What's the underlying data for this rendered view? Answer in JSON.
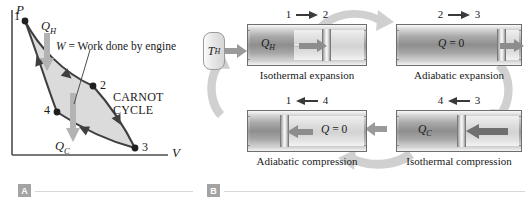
{
  "panel_a": {
    "tag": "A",
    "axes": {
      "y_label": "P",
      "x_label": "V"
    },
    "state_points": [
      {
        "id": "1",
        "label": "1"
      },
      {
        "id": "2",
        "label": "2"
      },
      {
        "id": "3",
        "label": "3"
      },
      {
        "id": "4",
        "label": "4"
      }
    ],
    "heat_in": {
      "symbol": "Q",
      "sub": "H"
    },
    "heat_out": {
      "symbol": "Q",
      "sub": "C"
    },
    "work_label": {
      "lhs": "W",
      "rest": " = Work done by engine"
    },
    "cycle_label_line1": "CARNOT",
    "cycle_label_line2": "CYCLE",
    "colors": {
      "curve": "#3f3f3f",
      "fill": "#d8d8d8",
      "heat_arrow": "#b0b0b0",
      "axis": "#4a4a4a"
    }
  },
  "panel_b": {
    "tag": "B",
    "reservoirs": [
      {
        "name": "hot",
        "symbol": "T",
        "sub": "H"
      },
      {
        "name": "cold",
        "symbol": "T",
        "sub": "C"
      }
    ],
    "stages": [
      {
        "id": "isothermal-expansion",
        "from": "1",
        "to": "2",
        "direction": "right",
        "heat_symbol": "Q",
        "heat_sub": "H",
        "heat_text": "",
        "caption": "Isothermal expansion"
      },
      {
        "id": "adiabatic-expansion",
        "from": "2",
        "to": "3",
        "direction": "right",
        "heat_symbol": "Q",
        "heat_sub": "",
        "heat_text": " = 0",
        "caption": "Adiabatic expansion"
      },
      {
        "id": "adiabatic-compression",
        "from": "4",
        "to": "1",
        "direction": "left",
        "heat_symbol": "Q",
        "heat_sub": "",
        "heat_text": " = 0",
        "caption": "Adiabatic compression"
      },
      {
        "id": "isothermal-compression",
        "from": "3",
        "to": "4",
        "direction": "left",
        "heat_symbol": "Q",
        "heat_sub": "C",
        "heat_text": "",
        "caption": "Isothermal compression"
      }
    ],
    "colors": {
      "piston_arrow": "#8d8d8d",
      "cycle_arrow": "#cfcfcf",
      "cylinder_border": "#6e6e6e"
    }
  }
}
